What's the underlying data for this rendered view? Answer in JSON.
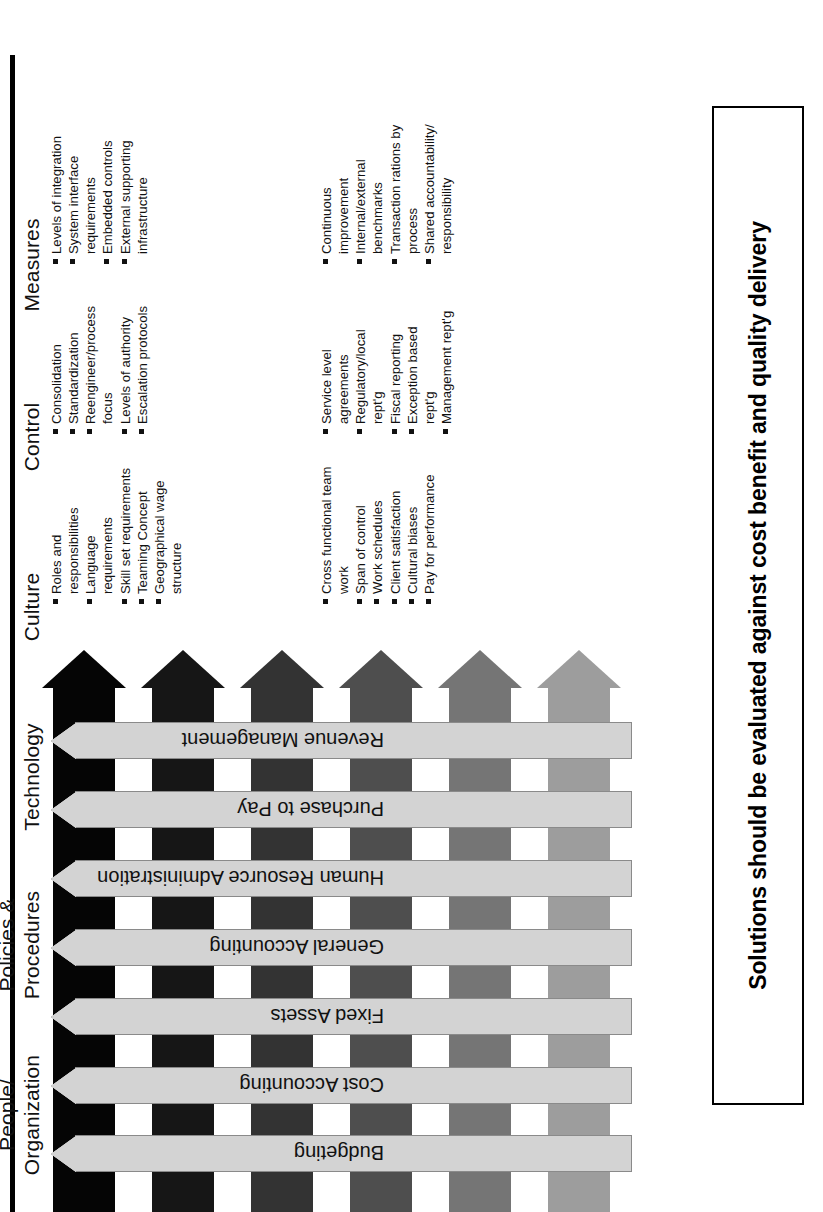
{
  "figure": {
    "title_rule": "",
    "caption": "Solutions should be evaluated against cost benefit and quality delivery"
  },
  "colors": {
    "process_arrow": "#d3d3d3",
    "process_arrow_border": "#8a8a8a",
    "band_measures": "#9d9d9d",
    "band_control": "#757575",
    "band_culture": "#4e4e4e",
    "band_technology": "#333333",
    "band_policies": "#161616",
    "band_people": "#050505",
    "text": "#111111",
    "rule": "#000000"
  },
  "categories": [
    {
      "id": "people-organization",
      "label": "People/\nOrganization",
      "band_color": "#050505",
      "bullets": [
        "Roles and responsibilities",
        "Language requirements",
        "Skill set requirements",
        "Teaming Concept",
        "Geographical wage structure"
      ]
    },
    {
      "id": "policies-procedures",
      "label": "Policies &\nProcedures",
      "band_color": "#161616",
      "bullets": [
        "Consolidation",
        "Standardization",
        "Reengineer/process focus",
        "Levels of authority",
        "Escalation protocols"
      ]
    },
    {
      "id": "technology",
      "label": "Technology",
      "band_color": "#333333",
      "bullets": [
        "Levels of integration",
        "System interface requirements",
        "Embedded controls",
        "External supporting infrastructure"
      ]
    },
    {
      "id": "culture",
      "label": "Culture",
      "band_color": "#4e4e4e",
      "bullets": [
        "Cross functional team work",
        "Span of control",
        "Work schedules",
        "Client satisfaction",
        "Cultural biases",
        "Pay for performance"
      ]
    },
    {
      "id": "control",
      "label": "Control",
      "band_color": "#757575",
      "bullets": [
        "Service level agreements",
        "Regulatory/local rept'g",
        "Fiscal reporting",
        "Exception based rept'g",
        "Management rept'g"
      ]
    },
    {
      "id": "measures",
      "label": "Measures",
      "band_color": "#9d9d9d",
      "bullets": [
        "Continuous improvement",
        "Internal/external benchmarks",
        "Transaction rations by process",
        "Shared accountability/ responsibility"
      ]
    }
  ],
  "processes": [
    {
      "id": "budgeting",
      "label": "Budgeting"
    },
    {
      "id": "cost-accounting",
      "label": "Cost Accounting"
    },
    {
      "id": "fixed-assets",
      "label": "Fixed Assets"
    },
    {
      "id": "general-accounting",
      "label": "General Accounting"
    },
    {
      "id": "human-resource-administration",
      "label": "Human Resource Administration"
    },
    {
      "id": "purchase-to-pay",
      "label": "Purchase to Pay"
    },
    {
      "id": "revenue-management",
      "label": "Revenue Management"
    }
  ]
}
